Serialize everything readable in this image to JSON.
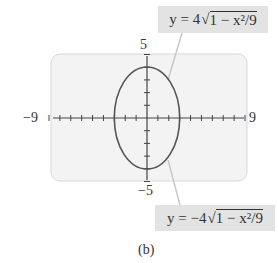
{
  "figure": {
    "caption": "(b)",
    "top_equation": {
      "prefix": "y = 4",
      "radicand": "1 − x²/9"
    },
    "bottom_equation": {
      "prefix": "y = −4",
      "radicand": "1 − x²/9"
    },
    "window": {
      "xmin_label": "−9",
      "xmax_label": "9",
      "ymax_label": "5",
      "ymin_label": "−5"
    },
    "colors": {
      "screen_bg": "#f3f3f3",
      "screen_border": "#d8d8d8",
      "curve": "#555555",
      "axis": "#444444",
      "label_bg": "#e3e3e3",
      "leader_line": "#c8c8c8"
    }
  },
  "chart_data": {
    "type": "line",
    "title": "",
    "xlim": [
      -9,
      9
    ],
    "ylim": [
      -5,
      5
    ],
    "x_ticks_step": 1,
    "y_ticks_step": 1,
    "series": [
      {
        "name": "y = 4√(1 − x²/9)",
        "x": [
          -3,
          -2,
          -1,
          0,
          1,
          2,
          3
        ],
        "values": [
          0,
          2.98,
          3.77,
          4,
          3.77,
          2.98,
          0
        ]
      },
      {
        "name": "y = −4√(1 − x²/9)",
        "x": [
          -3,
          -2,
          -1,
          0,
          1,
          2,
          3
        ],
        "values": [
          0,
          -2.98,
          -3.77,
          -4,
          -3.77,
          -2.98,
          0
        ]
      }
    ],
    "grid": false,
    "annotations": [
      "5",
      "−5",
      "−9",
      "9",
      "(b)"
    ]
  }
}
